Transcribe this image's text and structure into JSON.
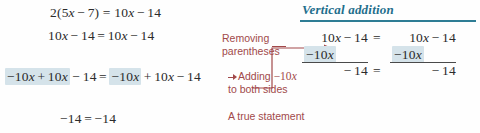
{
  "figure": {
    "kind": "algebra-worked-example",
    "colors": {
      "math_text": "#2b2b2b",
      "annotation_red": "#a1494a",
      "heading_blue": "#1f6e8c",
      "rule_blue": "#2e7d95",
      "highlight": "#d5e3ea",
      "background": "#fefefe"
    }
  },
  "left_steps": [
    {
      "id": "step-1",
      "parts": [
        {
          "text": "2(5",
          "style": "plain"
        },
        {
          "text": "x",
          "style": "var"
        },
        {
          "text": "−",
          "style": "op"
        },
        {
          "text": "7) =",
          "style": "plain"
        },
        {
          "text": "10",
          "style": "plain"
        },
        {
          "text": "x",
          "style": "var"
        },
        {
          "text": "−",
          "style": "op"
        },
        {
          "text": "14",
          "style": "plain"
        }
      ],
      "plain": "2(5x − 7) = 10x − 14"
    },
    {
      "id": "step-2",
      "plain": "10x − 14 = 10x − 14"
    },
    {
      "id": "step-3",
      "plain": "−10x + 10x − 14 = −10x + 10x − 14",
      "highlight_left": "−10x + 10x",
      "highlight_right": "−10x"
    },
    {
      "id": "step-4",
      "plain": "−14 = −14"
    }
  ],
  "step_text": {
    "s1_a": "2(5",
    "s1_x1": "x",
    "s1_minus": "−",
    "s1_b": "7) =",
    "s1_c": "10",
    "s1_x2": "x",
    "s1_minus2": "−",
    "s1_d": "14",
    "s2_a": "10",
    "s2_x1": "x",
    "s2_m1": "−",
    "s2_b": "14",
    "s2_eq": "=",
    "s2_c": "10",
    "s2_x2": "x",
    "s2_m2": "−",
    "s2_d": "14",
    "s3_hl_a": "−10",
    "s3_hl_x1": "x",
    "s3_hl_plus": "+",
    "s3_hl_b": "10",
    "s3_hl_x2": "x",
    "s3_m1": "−",
    "s3_c": "14",
    "s3_eq": "=",
    "s3_hl2_a": "−10",
    "s3_hl2_x": "x",
    "s3_plus2": "+",
    "s3_d": "10",
    "s3_x3": "x",
    "s3_m2": "−",
    "s3_e": "14",
    "s4_a": "−14",
    "s4_eq": "=",
    "s4_b": "−14"
  },
  "annotations": {
    "removing_line1": "Removing",
    "removing_line2": "parentheses",
    "adding_line1_pre": "Adding",
    "adding_line1_math_a": "−10",
    "adding_line1_math_x": "x",
    "adding_line2": "to both sides",
    "true_statement": "A true statement"
  },
  "right_panel": {
    "title": "Vertical addition",
    "rows": {
      "top_left_a": "10",
      "top_left_x": "x",
      "top_left_m": "−",
      "top_left_b": "14",
      "eq_top": "=",
      "top_right_a": "10",
      "top_right_x": "x",
      "top_right_m": "−",
      "top_right_b": "14",
      "mid_left_a": "−10",
      "mid_left_x": "x",
      "mid_right_a": "−10",
      "mid_right_x": "x",
      "bot_left_m": "−",
      "bot_left_b": "14",
      "eq_bot": "=",
      "bot_right_m": "−",
      "bot_right_b": "14"
    }
  }
}
